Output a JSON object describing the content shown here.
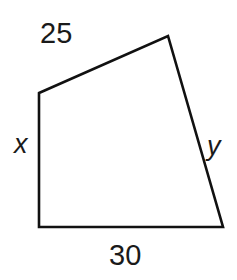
{
  "diagram": {
    "type": "quadrilateral",
    "vertices": {
      "top_left": [
        39,
        93
      ],
      "top_right": [
        168,
        36
      ],
      "bottom_right": [
        223,
        227
      ],
      "bottom_left": [
        39,
        227
      ]
    },
    "stroke_color": "#111111",
    "fill_color": "#ffffff",
    "background_color": "#ffffff",
    "labels": {
      "top": "25",
      "bottom": "30",
      "left": "x",
      "right": "y"
    }
  }
}
